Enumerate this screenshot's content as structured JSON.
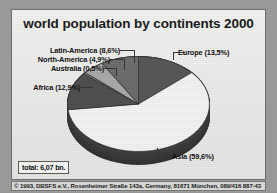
{
  "chart_data": {
    "type": "pie",
    "title": "world population by continents 2000",
    "xlabel": "",
    "ylabel": "",
    "legend_position": "callout-labels",
    "grid": false,
    "total_label": "total: 6,07 bn.",
    "categories": [
      "Europe",
      "Asia",
      "Africa",
      "Australia",
      "North-America",
      "Latin-America"
    ],
    "values": [
      13.5,
      59.6,
      12.9,
      0.5,
      4.9,
      8.6
    ],
    "value_strings": [
      "13,5%",
      "59,6%",
      "12,9%",
      "0,5%",
      "4,9%",
      "8,6%"
    ],
    "slices": [
      {
        "name": "Europe",
        "percent": 13.5,
        "percent_text": "13,5%",
        "label": "Europe (13,5%)",
        "color": "#565656"
      },
      {
        "name": "Asia",
        "percent": 59.6,
        "percent_text": "59,6%",
        "label": "Asia (59,6%)",
        "color": "#f2f2f0"
      },
      {
        "name": "Africa",
        "percent": 12.9,
        "percent_text": "12,9%",
        "label": "Africa (12,9%)",
        "color": "#4e4e4e"
      },
      {
        "name": "Australia",
        "percent": 0.5,
        "percent_text": "0,5%",
        "label": "Australia (0,5%)",
        "color": "#8e8e8c"
      },
      {
        "name": "North-America",
        "percent": 4.9,
        "percent_text": "4,9%",
        "label": "North-America (4,9%)",
        "color": "#a8a8a6"
      },
      {
        "name": "Latin-America",
        "percent": 8.6,
        "percent_text": "8,6%",
        "label": "Latin-America (8,6%)",
        "color": "#6b6b6b"
      }
    ]
  },
  "header": {
    "title": "world population by continents 2000"
  },
  "labels": {
    "latin_america": "Latin-America (8,6%)",
    "north_america": "North-America (4,9%)",
    "australia": "Australia (0,5%)",
    "africa": "Africa (12,9%)",
    "europe": "Europe (13,5%)",
    "asia": "Asia (59,6%)"
  },
  "total": {
    "text": "total: 6,07 bn."
  },
  "footer": {
    "copyright": "© 1993, DBSFS e.V., Rosenheimer Straße 143a, Germany, 81671 München, 089/416 887-43"
  },
  "colors": {
    "panel_background": "#ececeb",
    "panel_border": "#6e6e6c",
    "outer_background": "#9a9a98",
    "pie_depth": "#3b3b3b",
    "text": "#101010"
  }
}
